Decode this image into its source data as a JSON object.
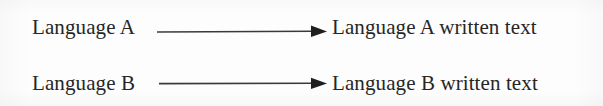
{
  "diagram": {
    "type": "flow-mapping",
    "background_color": "#fdfdfd",
    "text_color": "#262626",
    "arrow_color": "#3a3a3a",
    "rows": [
      {
        "source": "Language A",
        "target": "Language A written text",
        "connector": "arrow-right"
      },
      {
        "source": "Language B",
        "target": "Language B written text",
        "connector": "arrow-right"
      }
    ]
  }
}
